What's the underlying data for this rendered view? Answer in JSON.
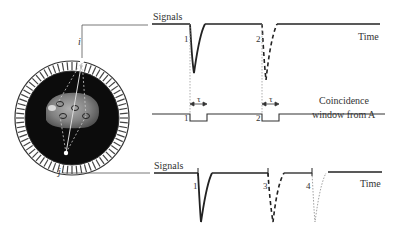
{
  "scanner": {
    "detector_i_label": "i",
    "detector_j_label": "j",
    "source_labels": [
      "1",
      "2",
      "3",
      "4"
    ]
  },
  "top_panel": {
    "title": "Signals",
    "axis_label": "Time",
    "pulse_labels": [
      "1",
      "2"
    ]
  },
  "coincidence_panel": {
    "label_line1": "Coincidence",
    "label_line2": "window from A",
    "window_labels": [
      "1",
      "2"
    ],
    "width_symbol": "τ"
  },
  "bottom_panel": {
    "title": "Signals",
    "axis_label": "Time",
    "pulse_labels": [
      "1",
      "3",
      "4"
    ]
  },
  "colors": {
    "line": "#222222",
    "guide": "#888888",
    "ring_bg": "#111111"
  }
}
